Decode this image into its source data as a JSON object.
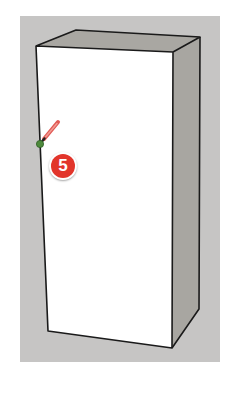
{
  "scene": {
    "background_panel_color": "#c6c5c4",
    "box": {
      "front_face_color": "#ffffff",
      "top_face_color": "#a9a7a2",
      "side_face_color": "#a8a6a1",
      "edge_color": "#1a1a1a"
    },
    "cursor": {
      "tool": "pencil-icon",
      "inference_point_color": "#4e8a3c"
    }
  },
  "step_badge": {
    "number": "5",
    "color": "#e2352b"
  }
}
